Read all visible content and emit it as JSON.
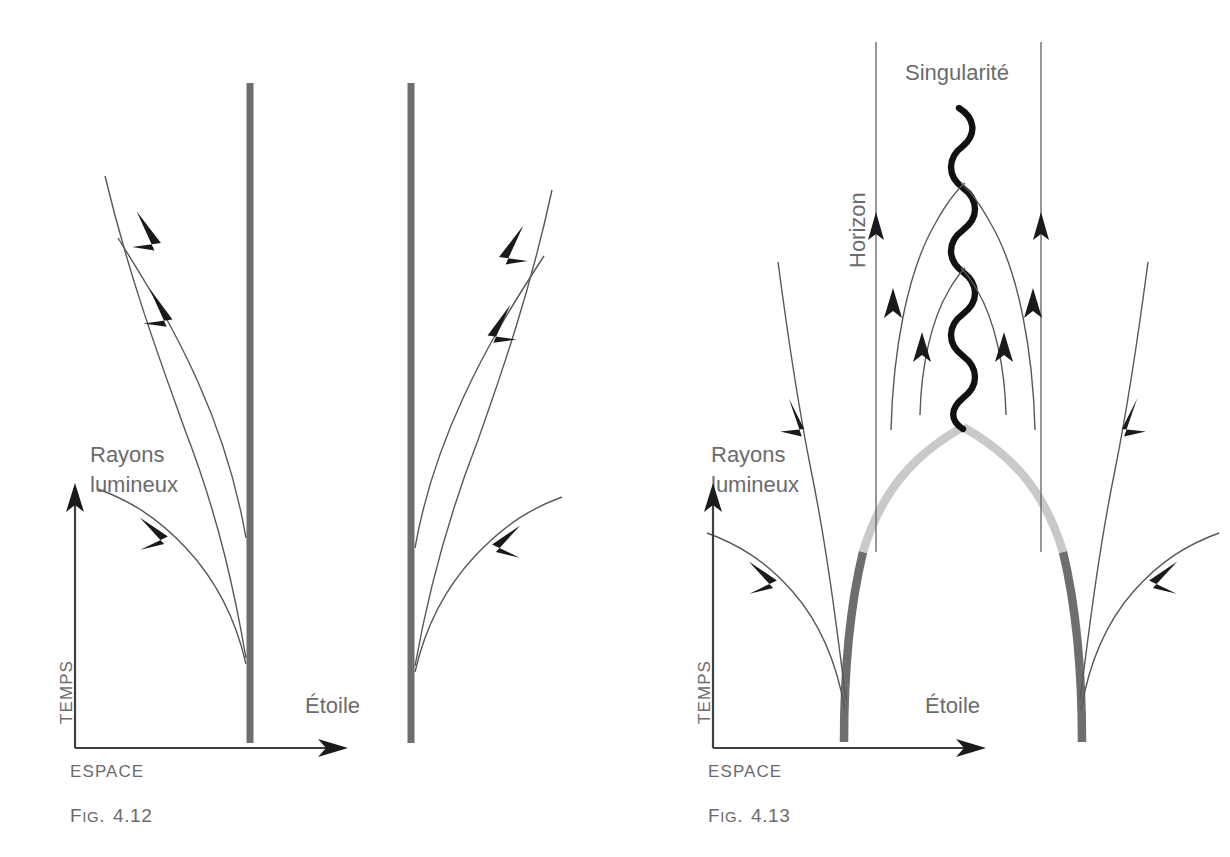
{
  "page": {
    "background": "#ffffff",
    "width": 1230,
    "height": 857,
    "ink_color": "#58585a",
    "star_color": "#6e6e70",
    "star_light_color": "#c9c9c9",
    "singularity_color": "#111111"
  },
  "figures": [
    {
      "id": "fig-4-12",
      "caption_prefix": "Fig.",
      "caption_number": "4.12",
      "caption": "Fig. 4.12",
      "axes": {
        "y_label": "TEMPS",
        "x_label": "ESPACE"
      },
      "labels": {
        "rays_line1": "Rayons",
        "rays_line2": "lumineux",
        "star": "Étoile"
      },
      "description": "Star world lines are two straight vertical gray bars; light rays escape outward on both sides, curving away from the star.",
      "star_worldlines": 2,
      "ray_count": 6
    },
    {
      "id": "fig-4-13",
      "caption_prefix": "Fig.",
      "caption_number": "4.13",
      "caption": "Fig. 4.13",
      "axes": {
        "y_label": "TEMPS",
        "x_label": "ESPACE"
      },
      "labels": {
        "rays_line1": "Rayons",
        "rays_line2": "lumineux",
        "star": "Étoile",
        "singularity": "Singularité",
        "horizon": "Horizon"
      },
      "description": "Collapsing star: surfaces curve inward, dark gray below the horizon crossing and light gray above it, meeting at the singularity. Rays inside the horizon are trapped and bend back into the singularity; rays outside escape.",
      "star_worldlines": 2,
      "horizon_lines": 2,
      "trapped_ray_pairs": 2,
      "escaping_ray_count": 4
    }
  ]
}
